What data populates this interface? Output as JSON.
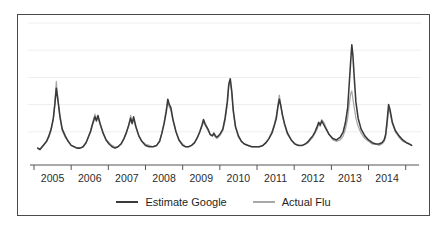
{
  "chart_data": {
    "type": "line",
    "title": "",
    "subtitle": "",
    "xlabel": "",
    "ylabel": "",
    "grid": true,
    "grid_orientation": "horizontal",
    "legend_position": "bottom-center",
    "xlim": [
      2004.5,
      2014.75
    ],
    "ylim": [
      0,
      100
    ],
    "xtick_labels": [
      "2005",
      "2006",
      "2007",
      "2008",
      "2009",
      "2010",
      "2011",
      "2012",
      "2013",
      "2014"
    ],
    "xtick_values": [
      2005,
      2006,
      2007,
      2008,
      2009,
      2010,
      2011,
      2012,
      2013,
      2014
    ],
    "ytick_labels": [],
    "gridline_values": [
      20,
      40,
      60,
      80,
      100
    ],
    "colors": {
      "estimate_google": "#3a3a3a",
      "actual_flu": "#a8a8a8",
      "frame": "#4a4a4a",
      "axis": "#555555",
      "gridline": "#eeeeee",
      "background": "#ffffff",
      "tick_label": "#2b2b2b"
    },
    "series": [
      {
        "name": "Estimate Google",
        "color": "#3a3a3a",
        "x": [
          2004.6,
          2004.66,
          2004.72,
          2004.78,
          2004.84,
          2004.9,
          2004.96,
          2005.02,
          2005.06,
          2005.1,
          2005.14,
          2005.2,
          2005.26,
          2005.34,
          2005.42,
          2005.5,
          2005.58,
          2005.66,
          2005.74,
          2005.82,
          2005.9,
          2005.96,
          2006.02,
          2006.08,
          2006.14,
          2006.18,
          2006.22,
          2006.28,
          2006.36,
          2006.44,
          2006.52,
          2006.6,
          2006.68,
          2006.76,
          2006.84,
          2006.92,
          2006.98,
          2007.04,
          2007.1,
          2007.14,
          2007.18,
          2007.24,
          2007.32,
          2007.4,
          2007.5,
          2007.6,
          2007.7,
          2007.8,
          2007.88,
          2007.94,
          2008.0,
          2008.06,
          2008.1,
          2008.14,
          2008.18,
          2008.24,
          2008.32,
          2008.4,
          2008.5,
          2008.58,
          2008.66,
          2008.74,
          2008.82,
          2008.9,
          2008.96,
          2009.02,
          2009.06,
          2009.1,
          2009.14,
          2009.18,
          2009.24,
          2009.3,
          2009.34,
          2009.38,
          2009.42,
          2009.46,
          2009.52,
          2009.58,
          2009.64,
          2009.7,
          2009.74,
          2009.78,
          2009.82,
          2009.86,
          2009.92,
          2010.0,
          2010.08,
          2010.16,
          2010.26,
          2010.36,
          2010.46,
          2010.56,
          2010.66,
          2010.74,
          2010.82,
          2010.9,
          2010.96,
          2011.02,
          2011.06,
          2011.1,
          2011.14,
          2011.18,
          2011.24,
          2011.32,
          2011.42,
          2011.52,
          2011.62,
          2011.72,
          2011.8,
          2011.88,
          2011.94,
          2012.0,
          2012.06,
          2012.12,
          2012.16,
          2012.2,
          2012.24,
          2012.3,
          2012.36,
          2012.44,
          2012.54,
          2012.64,
          2012.74,
          2012.82,
          2012.88,
          2012.94,
          2012.98,
          2013.02,
          2013.05,
          2013.08,
          2013.12,
          2013.16,
          2013.22,
          2013.3,
          2013.4,
          2013.5,
          2013.6,
          2013.7,
          2013.78,
          2013.86,
          2013.92,
          2013.96,
          2014.0,
          2014.04,
          2014.08,
          2014.14,
          2014.22,
          2014.32,
          2014.42,
          2014.52,
          2014.6,
          2014.66
        ],
        "values": [
          8,
          7,
          9,
          11,
          13,
          17,
          22,
          30,
          40,
          52,
          44,
          31,
          22,
          17,
          13,
          10,
          9,
          8,
          8,
          9,
          12,
          16,
          20,
          26,
          31,
          28,
          32,
          26,
          19,
          14,
          11,
          9,
          8,
          9,
          11,
          15,
          19,
          24,
          30,
          26,
          31,
          24,
          17,
          13,
          10,
          9,
          9,
          10,
          13,
          19,
          26,
          35,
          44,
          40,
          38,
          29,
          20,
          14,
          10,
          9,
          9,
          10,
          12,
          16,
          20,
          25,
          29,
          26,
          24,
          22,
          18,
          17,
          19,
          17,
          16,
          17,
          19,
          22,
          30,
          42,
          55,
          59,
          50,
          36,
          24,
          17,
          13,
          11,
          10,
          9,
          9,
          9,
          10,
          12,
          15,
          19,
          24,
          30,
          38,
          44,
          39,
          33,
          26,
          19,
          14,
          11,
          10,
          10,
          11,
          13,
          15,
          17,
          20,
          24,
          27,
          25,
          28,
          25,
          22,
          18,
          15,
          14,
          16,
          20,
          27,
          38,
          55,
          72,
          84,
          76,
          58,
          42,
          30,
          22,
          17,
          14,
          12,
          11,
          11,
          12,
          14,
          18,
          28,
          40,
          36,
          27,
          21,
          17,
          14,
          12,
          11,
          10
        ]
      },
      {
        "name": "Actual Flu",
        "color": "#a8a8a8",
        "x": [
          2004.6,
          2004.66,
          2004.72,
          2004.78,
          2004.84,
          2004.9,
          2004.96,
          2005.02,
          2005.06,
          2005.1,
          2005.14,
          2005.2,
          2005.26,
          2005.34,
          2005.42,
          2005.5,
          2005.58,
          2005.66,
          2005.74,
          2005.82,
          2005.9,
          2005.96,
          2006.02,
          2006.08,
          2006.14,
          2006.18,
          2006.22,
          2006.28,
          2006.36,
          2006.44,
          2006.52,
          2006.6,
          2006.68,
          2006.76,
          2006.84,
          2006.92,
          2006.98,
          2007.04,
          2007.1,
          2007.14,
          2007.18,
          2007.24,
          2007.32,
          2007.4,
          2007.5,
          2007.6,
          2007.7,
          2007.8,
          2007.88,
          2007.94,
          2008.0,
          2008.06,
          2008.1,
          2008.14,
          2008.18,
          2008.24,
          2008.32,
          2008.4,
          2008.5,
          2008.58,
          2008.66,
          2008.74,
          2008.82,
          2008.9,
          2008.96,
          2009.02,
          2009.06,
          2009.1,
          2009.14,
          2009.18,
          2009.24,
          2009.3,
          2009.34,
          2009.38,
          2009.42,
          2009.46,
          2009.52,
          2009.58,
          2009.64,
          2009.7,
          2009.74,
          2009.78,
          2009.82,
          2009.86,
          2009.92,
          2010.0,
          2010.08,
          2010.16,
          2010.26,
          2010.36,
          2010.46,
          2010.56,
          2010.66,
          2010.74,
          2010.82,
          2010.9,
          2010.96,
          2011.02,
          2011.06,
          2011.1,
          2011.14,
          2011.18,
          2011.24,
          2011.32,
          2011.42,
          2011.52,
          2011.62,
          2011.72,
          2011.8,
          2011.88,
          2011.94,
          2012.0,
          2012.06,
          2012.12,
          2012.16,
          2012.2,
          2012.24,
          2012.3,
          2012.36,
          2012.44,
          2012.54,
          2012.64,
          2012.74,
          2012.82,
          2012.88,
          2012.94,
          2012.98,
          2013.02,
          2013.05,
          2013.08,
          2013.12,
          2013.16,
          2013.22,
          2013.3,
          2013.4,
          2013.5,
          2013.6,
          2013.7,
          2013.78,
          2013.86,
          2013.92,
          2013.96,
          2014.0,
          2014.04,
          2014.08,
          2014.14,
          2014.22,
          2014.32,
          2014.42,
          2014.52,
          2014.6,
          2014.66
        ],
        "values": [
          8,
          7,
          9,
          11,
          13,
          16,
          21,
          29,
          41,
          57,
          45,
          30,
          21,
          16,
          13,
          10,
          9,
          8,
          8,
          9,
          12,
          16,
          21,
          27,
          33,
          29,
          30,
          25,
          19,
          14,
          12,
          10,
          9,
          9,
          11,
          15,
          19,
          24,
          32,
          27,
          29,
          23,
          17,
          13,
          11,
          10,
          9,
          10,
          13,
          19,
          27,
          37,
          42,
          38,
          36,
          28,
          20,
          14,
          11,
          9,
          9,
          10,
          12,
          16,
          20,
          24,
          27,
          25,
          23,
          21,
          18,
          17,
          18,
          16,
          15,
          16,
          18,
          21,
          28,
          40,
          54,
          57,
          48,
          35,
          23,
          16,
          13,
          11,
          10,
          9,
          9,
          9,
          10,
          12,
          15,
          20,
          25,
          32,
          39,
          47,
          40,
          32,
          25,
          18,
          14,
          11,
          10,
          10,
          11,
          12,
          14,
          16,
          19,
          22,
          26,
          24,
          29,
          27,
          23,
          18,
          14,
          13,
          14,
          17,
          22,
          30,
          40,
          48,
          50,
          44,
          37,
          30,
          24,
          19,
          15,
          13,
          11,
          11,
          10,
          11,
          13,
          16,
          25,
          37,
          34,
          26,
          20,
          16,
          13,
          12,
          11,
          10
        ]
      }
    ]
  },
  "legend": {
    "items": [
      {
        "label": "Estimate Google",
        "color": "#3a3a3a",
        "swatch": "thick-dark-line"
      },
      {
        "label": "Actual Flu",
        "color": "#a8a8a8",
        "swatch": "thin-gray-line"
      }
    ]
  },
  "axis": {
    "x_labels": [
      "2005",
      "2006",
      "2007",
      "2008",
      "2009",
      "2010",
      "2011",
      "2012",
      "2013",
      "2014"
    ]
  }
}
